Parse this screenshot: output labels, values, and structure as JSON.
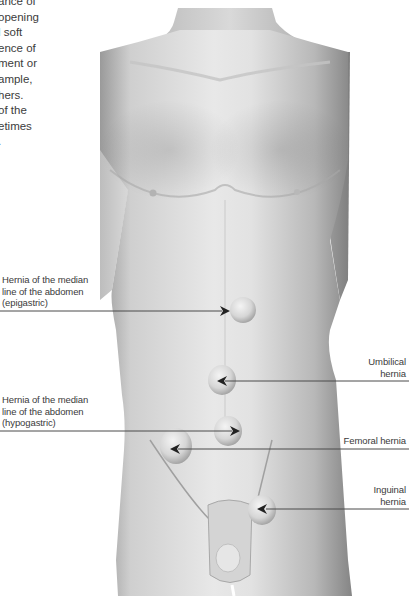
{
  "intro_text": {
    "lines": [
      "ance of",
      "opening",
      "l soft",
      "ence of",
      "ment or",
      "ample,",
      "hers.",
      "of the",
      "etimes",
      "."
    ]
  },
  "labels": {
    "epigastric": [
      "Hernia of the median",
      "line of the abdomen",
      "(epigastric)"
    ],
    "hypogastric": [
      "Hernia of the median",
      "line of the abdomen",
      "(hypogastric)"
    ],
    "umbilical": [
      "Umbilical",
      "hernia"
    ],
    "femoral": [
      "Femoral hernia"
    ],
    "inguinal": [
      "Inguinal",
      "hernia"
    ]
  },
  "colors": {
    "background": "#ffffff",
    "leader_line": "#4a4a4a",
    "skin_light": "#e6e6e6",
    "skin_mid": "#c8c8c8",
    "skin_dark": "#8f8f8f",
    "text": "#3a3a3a"
  }
}
